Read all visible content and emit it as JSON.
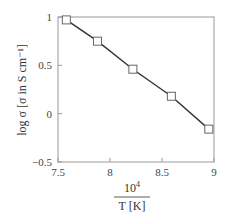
{
  "chart_data": {
    "type": "line",
    "title": "",
    "xlabel": "10^4 / T [K]",
    "xlabel_numerator": "10",
    "xlabel_exponent": "4",
    "xlabel_denominator": "T [K]",
    "ylabel": "log σ [σ in S cm⁻¹]",
    "xlim": [
      7.5,
      9
    ],
    "ylim": [
      -0.5,
      1
    ],
    "xticks": [
      7.5,
      8,
      8.5,
      9
    ],
    "xtick_labels": [
      "7.5",
      "8",
      "8.5",
      "9"
    ],
    "yticks": [
      -0.5,
      0,
      0.5,
      1
    ],
    "ytick_labels": [
      "−0.5",
      "0",
      "0.5",
      "1"
    ],
    "grid": false,
    "legend": null,
    "series": [
      {
        "name": "log σ",
        "marker": "open-square",
        "line_color": "#333333",
        "marker_color": "#666666",
        "x": [
          7.58,
          7.88,
          8.22,
          8.59,
          8.95
        ],
        "y": [
          0.97,
          0.75,
          0.46,
          0.18,
          -0.16
        ]
      }
    ]
  },
  "colors": {
    "axis": "#999999",
    "line": "#333333",
    "marker": "#666666"
  }
}
